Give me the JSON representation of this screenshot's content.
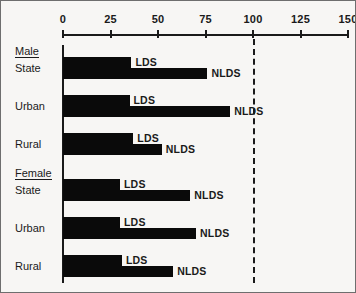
{
  "chart_data": {
    "type": "bar",
    "orientation": "horizontal",
    "title": "",
    "xlabel": "",
    "ylabel": "",
    "xlim": [
      0,
      150
    ],
    "xticks": [
      0,
      25,
      50,
      75,
      100,
      125,
      150
    ],
    "xtick_labels": [
      "0",
      "25",
      "50",
      "75",
      "100",
      "125",
      "150"
    ],
    "grid": false,
    "legend": "inline-end-labels",
    "reference_line": {
      "value": 100,
      "style": "dashed",
      "color": "#1a1a1a"
    },
    "series": [
      {
        "name": "LDS",
        "values": [
          36,
          35,
          37,
          30,
          30,
          31
        ]
      },
      {
        "name": "NLDS",
        "values": [
          76,
          88,
          52,
          67,
          70,
          58
        ]
      }
    ],
    "groups": [
      {
        "name": "Male",
        "categories": [
          "State",
          "Urban",
          "Rural"
        ],
        "rows": [
          {
            "category": "State",
            "lds": 36,
            "nlds": 76,
            "lds_label": "LDS",
            "nlds_label": "NLDS"
          },
          {
            "category": "Urban",
            "lds": 35,
            "nlds": 88,
            "lds_label": "LDS",
            "nlds_label": "NLDS"
          },
          {
            "category": "Rural",
            "lds": 37,
            "nlds": 52,
            "lds_label": "LDS",
            "nlds_label": "NLDS"
          }
        ]
      },
      {
        "name": "Female",
        "categories": [
          "State",
          "Urban",
          "Rural"
        ],
        "rows": [
          {
            "category": "State",
            "lds": 30,
            "nlds": 67,
            "lds_label": "LDS",
            "nlds_label": "NLDS"
          },
          {
            "category": "Urban",
            "lds": 30,
            "nlds": 70,
            "lds_label": "LDS",
            "nlds_label": "NLDS"
          },
          {
            "category": "Rural",
            "lds": 31,
            "nlds": 58,
            "lds_label": "LDS",
            "nlds_label": "NLDS"
          }
        ]
      }
    ],
    "colors": {
      "bar": "#0a0a0a",
      "axis": "#1a1a1a",
      "background": "#f7f6f4",
      "border": "#6e6e6e"
    }
  }
}
